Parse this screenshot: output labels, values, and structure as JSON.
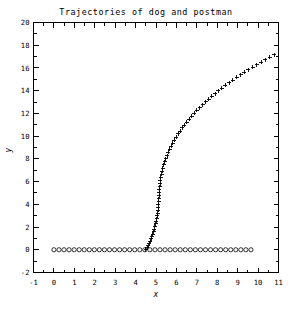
{
  "figure": {
    "width": 293,
    "height": 309,
    "background": "#ffffff",
    "foreground": "#000000"
  },
  "chart_data": {
    "type": "scatter",
    "title": "Trajectories of dog and postman",
    "xlabel": "x",
    "ylabel": "y",
    "xlim": [
      -1,
      11
    ],
    "ylim": [
      -2,
      20
    ],
    "xticks": [
      -1,
      0,
      1,
      2,
      3,
      4,
      5,
      6,
      7,
      8,
      9,
      10,
      11
    ],
    "yticks": [
      -2,
      0,
      2,
      4,
      6,
      8,
      10,
      12,
      14,
      16,
      18,
      20
    ],
    "xticklabels": [
      "-1",
      "0",
      "1",
      "2",
      "3",
      "4",
      "5",
      "6",
      "7",
      "8",
      "9",
      "10",
      "11"
    ],
    "yticklabels": [
      "-2",
      "0",
      "2",
      "4",
      "6",
      "8",
      "10",
      "12",
      "14",
      "16",
      "18",
      "20"
    ],
    "minor_ticks": true,
    "grid": false,
    "legend": false,
    "legend_position": "none",
    "series": [
      {
        "name": "dog",
        "marker": "plus",
        "color": "#000000",
        "points": [
          [
            4.51,
            0.0
          ],
          [
            4.56,
            0.18
          ],
          [
            4.61,
            0.37
          ],
          [
            4.66,
            0.56
          ],
          [
            4.71,
            0.76
          ],
          [
            4.76,
            0.96
          ],
          [
            4.8,
            1.17
          ],
          [
            4.84,
            1.38
          ],
          [
            4.88,
            1.6
          ],
          [
            4.92,
            1.82
          ],
          [
            4.95,
            2.05
          ],
          [
            4.98,
            2.28
          ],
          [
            5.01,
            2.51
          ],
          [
            5.04,
            2.75
          ],
          [
            5.06,
            2.99
          ],
          [
            5.08,
            3.23
          ],
          [
            5.1,
            3.48
          ],
          [
            5.11,
            3.73
          ],
          [
            5.12,
            3.98
          ],
          [
            5.13,
            4.24
          ],
          [
            5.14,
            4.5
          ],
          [
            5.15,
            4.76
          ],
          [
            5.16,
            5.02
          ],
          [
            5.17,
            5.29
          ],
          [
            5.18,
            5.56
          ],
          [
            5.2,
            5.83
          ],
          [
            5.22,
            6.1
          ],
          [
            5.24,
            6.37
          ],
          [
            5.27,
            6.64
          ],
          [
            5.3,
            6.92
          ],
          [
            5.34,
            7.19
          ],
          [
            5.38,
            7.47
          ],
          [
            5.43,
            7.74
          ],
          [
            5.48,
            8.02
          ],
          [
            5.54,
            8.29
          ],
          [
            5.6,
            8.57
          ],
          [
            5.67,
            8.84
          ],
          [
            5.74,
            9.11
          ],
          [
            5.82,
            9.38
          ],
          [
            5.9,
            9.65
          ],
          [
            5.99,
            9.92
          ],
          [
            6.08,
            10.19
          ],
          [
            6.18,
            10.45
          ],
          [
            6.28,
            10.72
          ],
          [
            6.39,
            10.98
          ],
          [
            6.5,
            11.24
          ],
          [
            6.62,
            11.5
          ],
          [
            6.74,
            11.76
          ],
          [
            6.87,
            12.01
          ],
          [
            7.0,
            12.27
          ],
          [
            7.14,
            12.52
          ],
          [
            7.28,
            12.77
          ],
          [
            7.43,
            13.02
          ],
          [
            7.58,
            13.26
          ],
          [
            7.74,
            13.51
          ],
          [
            7.9,
            13.75
          ],
          [
            8.06,
            13.99
          ],
          [
            8.23,
            14.23
          ],
          [
            8.4,
            14.47
          ],
          [
            8.58,
            14.7
          ],
          [
            8.76,
            14.94
          ],
          [
            8.95,
            15.17
          ],
          [
            9.14,
            15.4
          ],
          [
            9.33,
            15.62
          ],
          [
            9.53,
            15.85
          ],
          [
            9.73,
            16.07
          ],
          [
            9.94,
            16.3
          ],
          [
            10.15,
            16.52
          ],
          [
            10.36,
            16.73
          ],
          [
            10.58,
            16.95
          ],
          [
            10.8,
            17.16
          ],
          [
            11.02,
            17.38
          ],
          [
            11.25,
            17.59
          ],
          [
            11.48,
            17.8
          ],
          [
            11.72,
            18.0
          ],
          [
            11.95,
            18.21
          ],
          [
            12.19,
            18.41
          ],
          [
            12.44,
            18.61
          ],
          [
            12.69,
            18.81
          ]
        ],
        "note": "pursuit curve of dog, descends from upper right to x-axis"
      },
      {
        "name": "postman",
        "marker": "circle",
        "color": "#000000",
        "y_constant": 0.0,
        "x_start": 0.0,
        "x_end": 9.65,
        "n_points": 40,
        "note": "postman walks along y = 0 from x = 0 to x = 9.65"
      }
    ]
  }
}
